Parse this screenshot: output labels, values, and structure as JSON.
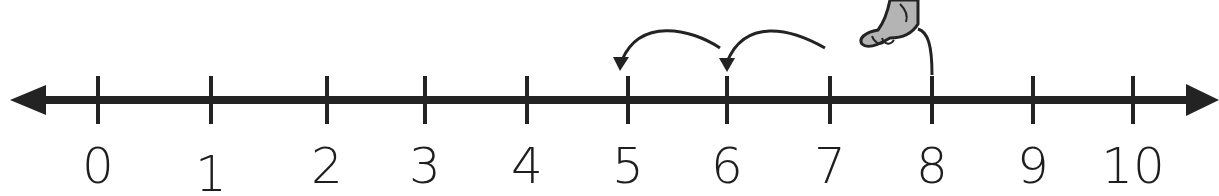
{
  "number_line": {
    "min": 0,
    "max": 10,
    "ticks": [
      {
        "value": 0,
        "label": "0",
        "x": 98
      },
      {
        "value": 1,
        "label": "1",
        "x": 211
      },
      {
        "value": 2,
        "label": "2",
        "x": 327
      },
      {
        "value": 3,
        "label": "3",
        "x": 425
      },
      {
        "value": 4,
        "label": "4",
        "x": 527
      },
      {
        "value": 5,
        "label": "5",
        "x": 628
      },
      {
        "value": 6,
        "label": "6",
        "x": 727
      },
      {
        "value": 7,
        "label": "7",
        "x": 830
      },
      {
        "value": 8,
        "label": "8",
        "x": 932
      },
      {
        "value": 9,
        "label": "9",
        "x": 1033
      },
      {
        "value": 10,
        "label": "10",
        "x": 1133
      }
    ],
    "line_color": "#232323",
    "arrows": [
      "left",
      "right"
    ]
  },
  "hops": [
    {
      "from": 8,
      "to": 7,
      "type": "launch-line"
    },
    {
      "from": 7,
      "to": 6,
      "type": "arrow"
    },
    {
      "from": 6,
      "to": 5,
      "type": "arrow"
    }
  ],
  "figure": {
    "icon": "animal-foot-icon",
    "position_value": 8,
    "fill": "#b4b4b4"
  }
}
